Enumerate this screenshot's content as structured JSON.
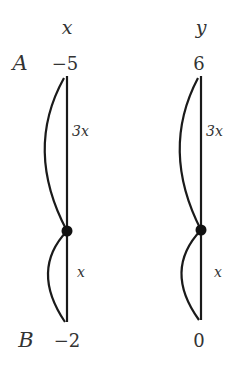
{
  "diagram": {
    "type": "number-line-ratio",
    "color": "#1a1a1a",
    "axes": [
      {
        "variable": "x",
        "top_value": "−5",
        "bottom_value": "−2",
        "upper_segment_label": "3x",
        "lower_segment_label": "x"
      },
      {
        "variable": "y",
        "top_value": "6",
        "bottom_value": "0",
        "upper_segment_label": "3x",
        "lower_segment_label": "x"
      }
    ],
    "point_labels": {
      "top": "A",
      "bottom": "B"
    }
  }
}
